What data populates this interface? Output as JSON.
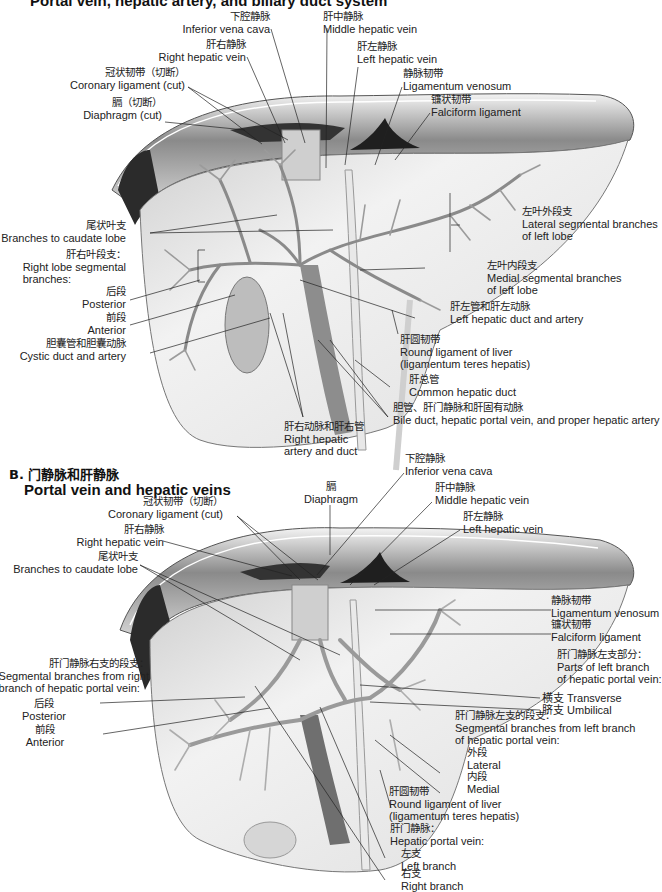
{
  "panel_a": {
    "title": "Portal vein, hepatic artery, and biliary duct system",
    "labels": {
      "ivc": {
        "zh": "下腔静脉",
        "en": "Inferior vena cava"
      },
      "mhv": {
        "zh": "肝中静脉",
        "en": "Middle hepatic vein"
      },
      "rhv": {
        "zh": "肝右静脉",
        "en": "Right hepatic vein"
      },
      "lhv": {
        "zh": "肝左静脉",
        "en": "Left hepatic vein"
      },
      "coronary": {
        "zh": "冠状韧带（切断）",
        "en": "Coronary ligament (cut)"
      },
      "lig_venosum": {
        "zh": "静脉韧带",
        "en": "Ligamentum venosum"
      },
      "diaphragm": {
        "zh": "膈（切断）",
        "en": "Diaphragm (cut)"
      },
      "falciform": {
        "zh": "镰状韧带",
        "en": "Falciform ligament"
      },
      "caudate": {
        "zh": "尾状叶支",
        "en": "Branches to caudate lobe"
      },
      "lateral_seg": {
        "zh": "左叶外段支",
        "en1": "Lateral segmental branches",
        "en2": "of left lobe"
      },
      "right_lobe": {
        "zh": "肝右叶段支：",
        "en1": "Right lobe  segmental",
        "en2": "branches:"
      },
      "medial_seg": {
        "zh": "左叶内段支",
        "en1": "Medial segmental branches",
        "en2": "of left lobe"
      },
      "posterior": {
        "zh": "后段",
        "en": "Posterior"
      },
      "left_duct_artery": {
        "zh": "肝左管和肝左动脉",
        "en": "Left hepatic duct and artery"
      },
      "anterior": {
        "zh": "前段",
        "en": "Anterior"
      },
      "cystic": {
        "zh": "胆囊管和胆囊动脉",
        "en": "Cystic duct and artery"
      },
      "round_lig": {
        "zh": "肝圆韧带",
        "en1": "Round ligament of liver",
        "en2": "(ligamentum teres hepatis)"
      },
      "common_duct": {
        "zh": "肝总管",
        "en": "Common hepatic duct"
      },
      "bile_duct": {
        "zh": "胆管、肝门静脉和肝固有动脉",
        "en": "Bile duct, hepatic portal vein, and proper hepatic artery"
      },
      "right_artery_duct": {
        "zh": "肝右动脉和肝右管",
        "en1": "Right hepatic",
        "en2": "artery and duct"
      }
    }
  },
  "panel_b": {
    "section_letter_zh": "B. 门静脉和肝静脉",
    "title": "Portal vein and hepatic veins",
    "labels": {
      "ivc": {
        "zh": "下腔静脉",
        "en": "Inferior vena cava"
      },
      "diaphragm": {
        "zh": "膈",
        "en": "Diaphragm"
      },
      "coronary": {
        "zh": "冠状韧带（切断）",
        "en": "Coronary ligament (cut)"
      },
      "mhv": {
        "zh": "肝中静脉",
        "en": "Middle hepatic vein"
      },
      "rhv": {
        "zh": "肝右静脉",
        "en": "Right hepatic vein"
      },
      "lhv": {
        "zh": "肝左静脉",
        "en": "Left hepatic vein"
      },
      "caudate": {
        "zh": "尾状叶支",
        "en": "Branches to caudate lobe"
      },
      "lig_venosum": {
        "zh": "静脉韧带",
        "en": "Ligamentum venosum"
      },
      "falciform": {
        "zh": "镰状韧带",
        "en": "Falciform ligament"
      },
      "left_parts": {
        "zh": "肝门静脉左支部分：",
        "en1": "Parts of left branch",
        "en2": "of hepatic portal vein:"
      },
      "right_segmental": {
        "zh": "肝门静脉右支的段支：",
        "en1": "Segmental branches from right",
        "en2": "branch of hepatic portal vein:"
      },
      "transverse": {
        "zh": "横支",
        "en": "Transverse"
      },
      "umbilical": {
        "zh": "脐支",
        "en": "Umbilical"
      },
      "posterior": {
        "zh": "后段",
        "en": "Posterior"
      },
      "left_segmental": {
        "zh": "肝门静脉左支的段支：",
        "en1": "Segmental branches  from left branch",
        "en2": "of hepatic portal vein:"
      },
      "anterior": {
        "zh": "前段",
        "en": "Anterior"
      },
      "lateral": {
        "zh": "外段",
        "en": "Lateral"
      },
      "medial": {
        "zh": "内段",
        "en": "Medial"
      },
      "round_lig": {
        "zh": "肝圆韧带",
        "en1": "Round ligament of liver",
        "en2": "(ligamentum teres hepatis)"
      },
      "portal_vein": {
        "zh": "肝门静脉：",
        "en": "Hepatic portal vein:"
      },
      "left_branch": {
        "zh": "左支",
        "en": "Left branch"
      },
      "right_branch": {
        "zh": "右支",
        "en": "Right branch"
      }
    }
  }
}
